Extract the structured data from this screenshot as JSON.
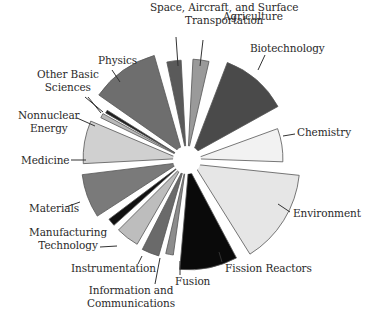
{
  "chart_data": {
    "type": "pie",
    "title": "",
    "exploded": true,
    "center": [
      187,
      160
    ],
    "slices": [
      {
        "label": "Agriculture",
        "start": 3,
        "end": 13,
        "r": 93,
        "color": "#9a9a9a",
        "value_pct": 3.4
      },
      {
        "label": "Biotechnology",
        "start": 21,
        "end": 61,
        "r": 98,
        "color": "#4a4a4a",
        "value_pct": 13.8
      },
      {
        "label": "Chemistry",
        "start": 70,
        "end": 92,
        "r": 88,
        "color": "#f2f2f2",
        "value_pct": 7.2
      },
      {
        "label": "Environment",
        "start": 96,
        "end": 148,
        "r": 106,
        "color": "#e6e6e6",
        "value_pct": 16.6
      },
      {
        "label": "Fission Reactors",
        "start": 152,
        "end": 185,
        "r": 102,
        "color": "#0a0a0a",
        "value_pct": 10.9
      },
      {
        "label": "Fusion",
        "start": 188,
        "end": 193,
        "r": 88,
        "color": "#8c8c8c",
        "value_pct": 1.9
      },
      {
        "label": "Information and Communications",
        "start": 196,
        "end": 207,
        "r": 92,
        "color": "#6a6a6a",
        "value_pct": 3.8
      },
      {
        "label": "Instrumentation",
        "start": 210,
        "end": 225,
        "r": 90,
        "color": "#bdbdbd",
        "value_pct": 5.0
      },
      {
        "label": "Manufacturing Technology",
        "start": 228,
        "end": 233,
        "r": 90,
        "color": "#111111",
        "value_pct": 1.9
      },
      {
        "label": "Materials",
        "start": 237,
        "end": 263,
        "r": 98,
        "color": "#7a7a7a",
        "value_pct": 8.8
      },
      {
        "label": "Medicine",
        "start": 267,
        "end": 293,
        "r": 96,
        "color": "#d0d0d0",
        "value_pct": 8.4
      },
      {
        "label": "Nonnuclear Energy",
        "start": 296,
        "end": 299,
        "r": 88,
        "color": "#b8b8b8",
        "value_pct": 1.3
      },
      {
        "label": "Other Basic Sciences",
        "start": 300,
        "end": 302,
        "r": 86,
        "color": "#1e1e1e",
        "value_pct": 0.9
      },
      {
        "label": "Physics",
        "start": 305,
        "end": 344,
        "r": 102,
        "color": "#6e6e6e",
        "value_pct": 13.1
      },
      {
        "label": "Space, Aircraft, and Surface Transportation",
        "start": 348,
        "end": 357,
        "r": 92,
        "color": "#5a5a5a",
        "value_pct": 3.1
      }
    ],
    "legend": "none",
    "labels_position": "outside with leader lines"
  },
  "labels": {
    "space": [
      "Space, Aircraft, and Surface",
      "Transportation"
    ],
    "agriculture": "Agriculture",
    "biotechnology": "Biotechnology",
    "chemistry": "Chemistry",
    "environment": "Environment",
    "fission": "Fission Reactors",
    "fusion": "Fusion",
    "infocomm": [
      "Information and",
      "Communications"
    ],
    "instrumentation": "Instrumentation",
    "manufacturing": [
      "Manufacturing",
      "Technology"
    ],
    "materials": "Materials",
    "medicine": "Medicine",
    "nonnuclear": [
      "Nonnuclear",
      "Energy"
    ],
    "otherbasic": [
      "Other Basic",
      "Sciences"
    ],
    "physics": "Physics"
  },
  "style": {
    "stroke": "#555555",
    "leader": "#333333"
  }
}
